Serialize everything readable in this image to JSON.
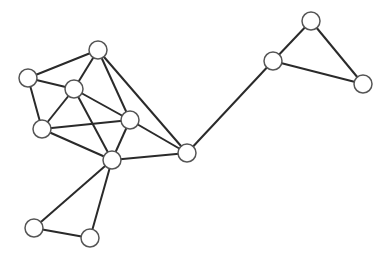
{
  "diagram": {
    "type": "undirected-graph",
    "node_radius": 9,
    "colors": {
      "edge": "#2a2a2a",
      "node_fill": "#ffffff",
      "node_stroke": "#555555",
      "background": "#ffffff"
    },
    "nodes": [
      {
        "id": "A",
        "x": 98,
        "y": 50
      },
      {
        "id": "B",
        "x": 28,
        "y": 78
      },
      {
        "id": "C",
        "x": 74,
        "y": 89
      },
      {
        "id": "D",
        "x": 42,
        "y": 129
      },
      {
        "id": "E",
        "x": 130,
        "y": 120
      },
      {
        "id": "F",
        "x": 112,
        "y": 160
      },
      {
        "id": "G",
        "x": 187,
        "y": 153
      },
      {
        "id": "H",
        "x": 34,
        "y": 228
      },
      {
        "id": "I",
        "x": 90,
        "y": 238
      },
      {
        "id": "J",
        "x": 273,
        "y": 61
      },
      {
        "id": "K",
        "x": 311,
        "y": 21
      },
      {
        "id": "L",
        "x": 363,
        "y": 84
      }
    ],
    "edges": [
      [
        "A",
        "B"
      ],
      [
        "A",
        "C"
      ],
      [
        "A",
        "E"
      ],
      [
        "A",
        "G"
      ],
      [
        "B",
        "C"
      ],
      [
        "B",
        "D"
      ],
      [
        "C",
        "D"
      ],
      [
        "C",
        "E"
      ],
      [
        "C",
        "F"
      ],
      [
        "D",
        "E"
      ],
      [
        "D",
        "F"
      ],
      [
        "E",
        "F"
      ],
      [
        "E",
        "G"
      ],
      [
        "F",
        "G"
      ],
      [
        "F",
        "H"
      ],
      [
        "F",
        "I"
      ],
      [
        "H",
        "I"
      ],
      [
        "G",
        "J"
      ],
      [
        "J",
        "K"
      ],
      [
        "J",
        "L"
      ],
      [
        "K",
        "L"
      ]
    ]
  }
}
